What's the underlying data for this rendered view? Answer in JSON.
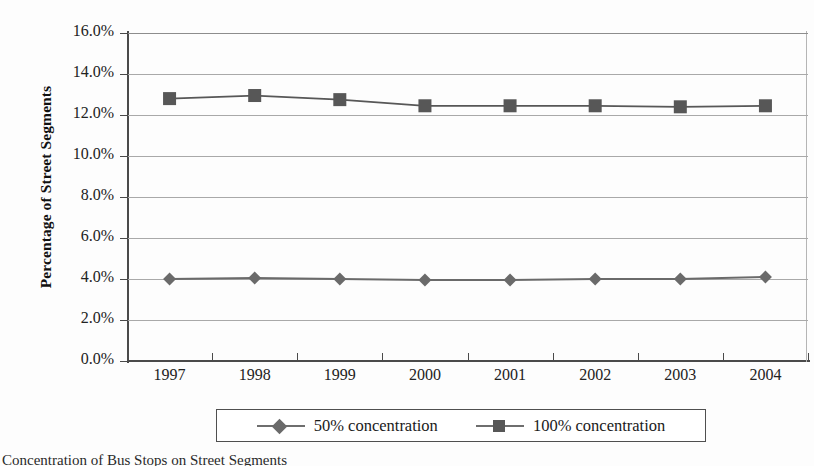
{
  "chart_data": {
    "type": "line",
    "title": "",
    "xlabel": "",
    "ylabel": "Percentage of Street Segments",
    "categories": [
      "1997",
      "1998",
      "1999",
      "2000",
      "2001",
      "2002",
      "2003",
      "2004"
    ],
    "series": [
      {
        "name": "50% concentration",
        "marker": "diamond",
        "color": "#6a6a6a",
        "values": [
          4.0,
          4.05,
          4.0,
          3.95,
          3.95,
          4.0,
          4.0,
          4.1
        ]
      },
      {
        "name": "100% concentration",
        "marker": "square",
        "color": "#575757",
        "values": [
          12.8,
          12.95,
          12.75,
          12.45,
          12.45,
          12.45,
          12.4,
          12.45
        ]
      }
    ],
    "ylim": [
      0.0,
      16.0
    ],
    "ytick_step": 2.0,
    "ytick_labels": [
      "0.0%",
      "2.0%",
      "4.0%",
      "6.0%",
      "8.0%",
      "10.0%",
      "12.0%",
      "14.0%",
      "16.0%"
    ],
    "grid": true,
    "grid_axis": "y",
    "legend_position": "bottom"
  },
  "axes": {
    "y_title": "Percentage of Street Segments",
    "y_ticks": [
      "16.0%",
      "14.0%",
      "12.0%",
      "10.0%",
      "8.0%",
      "6.0%",
      "4.0%",
      "2.0%",
      "0.0%"
    ],
    "x_ticks": [
      "1997",
      "1998",
      "1999",
      "2000",
      "2001",
      "2002",
      "2003",
      "2004"
    ]
  },
  "legend": {
    "entries": [
      {
        "label": "50% concentration",
        "marker": "diamond"
      },
      {
        "label": "100% concentration",
        "marker": "square"
      }
    ]
  },
  "caption": {
    "text": "Concentration of Bus Stops on Street Segments"
  },
  "colors": {
    "series_50": "#6a6a6a",
    "series_100": "#575757",
    "gridline": "#a9a9a9",
    "axis": "#4a4a4a",
    "text": "#1a1a1a"
  }
}
